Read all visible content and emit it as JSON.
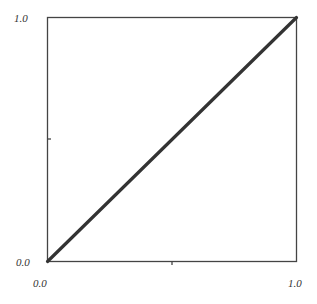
{
  "chart_data": {
    "type": "line",
    "title": "",
    "xlabel": "",
    "ylabel": "",
    "xlim": [
      0.0,
      1.0
    ],
    "ylim": [
      0.0,
      1.0
    ],
    "grid": false,
    "legend": null,
    "x_ticks": [
      0.0,
      0.5,
      1.0
    ],
    "y_ticks": [
      0.0,
      0.5,
      1.0
    ],
    "x_tick_labels": [
      "0.0",
      "",
      "1.0"
    ],
    "y_tick_labels": [
      "0.0",
      "",
      "1.0"
    ],
    "series": [
      {
        "name": "diagonal",
        "x": [
          0.0,
          1.0
        ],
        "y": [
          0.0,
          1.0
        ],
        "color": "#333333"
      }
    ]
  },
  "labels": {
    "y_top": "1.0",
    "y_bottom": "0.0",
    "x_left": "0.0",
    "x_right": "1.0"
  },
  "colors": {
    "axis": "#444444",
    "line": "#333333",
    "text": "#333333"
  }
}
